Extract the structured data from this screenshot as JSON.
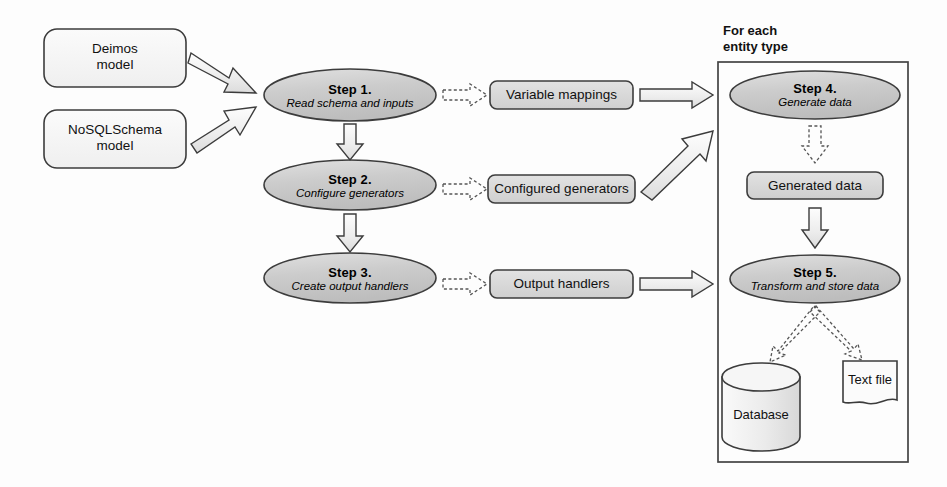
{
  "diagram": {
    "title_hidden": "",
    "colors": {
      "shape_fill_light": "#f2f2f2",
      "shape_fill_mid": "#d6d6d6",
      "ellipse_fill": "#c8c8c8",
      "stroke": "#3c3c3c",
      "arrow_fill": "#eeeeee",
      "text": "#111111",
      "panel_stroke": "#444444"
    },
    "inputs": [
      {
        "name": "deimos-model",
        "line1": "Deimos",
        "line2": "model"
      },
      {
        "name": "nosqlschema-model",
        "line1": "NoSQLSchema",
        "line2": "model"
      }
    ],
    "steps": [
      {
        "id": "step1",
        "title": "Step 1.",
        "subtitle": "Read schema and inputs"
      },
      {
        "id": "step2",
        "title": "Step 2.",
        "subtitle": "Configure generators"
      },
      {
        "id": "step3",
        "title": "Step 3.",
        "subtitle": "Create output handlers"
      },
      {
        "id": "step4",
        "title": "Step 4.",
        "subtitle": "Generate data"
      },
      {
        "id": "step5",
        "title": "Step 5.",
        "subtitle": "Transform and store data"
      }
    ],
    "artifacts": [
      {
        "id": "variable-mappings",
        "label": "Variable mappings"
      },
      {
        "id": "configured-generators",
        "label": "Configured generators"
      },
      {
        "id": "output-handlers",
        "label": "Output handlers"
      },
      {
        "id": "generated-data",
        "label": "Generated data"
      }
    ],
    "panel": {
      "title_line1": "For each",
      "title_line2": "entity type"
    },
    "stores": [
      {
        "id": "database",
        "label": "Database",
        "shape": "cylinder"
      },
      {
        "id": "text-file",
        "label": "Text file",
        "shape": "document"
      }
    ]
  }
}
